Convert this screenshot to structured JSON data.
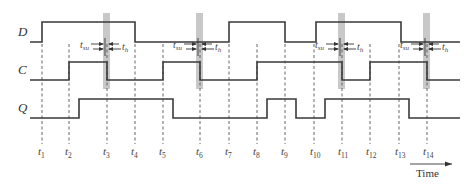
{
  "diagram": {
    "type": "timing-diagram",
    "signals": [
      {
        "name": "D",
        "y_high": 22,
        "y_low": 42,
        "transitions": [
          [
            30,
            "low"
          ],
          [
            42,
            "high"
          ],
          [
            135,
            "low"
          ],
          [
            229,
            "high"
          ],
          [
            285,
            "low"
          ],
          [
            316,
            "high"
          ],
          [
            401,
            "low"
          ],
          [
            460,
            "end"
          ]
        ]
      },
      {
        "name": "C",
        "y_high": 62,
        "y_low": 80,
        "transitions": [
          [
            30,
            "low"
          ],
          [
            69,
            "high"
          ],
          [
            107,
            "low"
          ],
          [
            163,
            "high"
          ],
          [
            200,
            "low"
          ],
          [
            257,
            "high"
          ],
          [
            342,
            "low"
          ],
          [
            370,
            "high"
          ],
          [
            427,
            "low"
          ],
          [
            460,
            "end"
          ]
        ]
      },
      {
        "name": "Q",
        "y_high": 99,
        "y_low": 118,
        "transitions": [
          [
            30,
            "low"
          ],
          [
            79,
            "high"
          ],
          [
            173,
            "low"
          ],
          [
            267,
            "high"
          ],
          [
            296,
            "low"
          ],
          [
            325,
            "high"
          ],
          [
            409,
            "low"
          ],
          [
            460,
            "end"
          ]
        ]
      }
    ],
    "time_markers": [
      {
        "base": "t",
        "sub": "1",
        "x": 42
      },
      {
        "base": "t",
        "sub": "2",
        "x": 69
      },
      {
        "base": "t",
        "sub": "3",
        "x": 107
      },
      {
        "base": "t",
        "sub": "4",
        "x": 135
      },
      {
        "base": "t",
        "sub": "5",
        "x": 163
      },
      {
        "base": "t",
        "sub": "6",
        "x": 200
      },
      {
        "base": "t",
        "sub": "7",
        "x": 229
      },
      {
        "base": "t",
        "sub": "8",
        "x": 257
      },
      {
        "base": "t",
        "sub": "9",
        "x": 285
      },
      {
        "base": "t",
        "sub": "10",
        "x": 314
      },
      {
        "base": "t",
        "sub": "11",
        "x": 342
      },
      {
        "base": "t",
        "sub": "12",
        "x": 370
      },
      {
        "base": "t",
        "sub": "13",
        "x": 399
      },
      {
        "base": "t",
        "sub": "14",
        "x": 427
      }
    ],
    "setup_hold_windows": [
      {
        "x": 107,
        "tsu_label": "t",
        "tsu_sub": "su",
        "th_label": "t",
        "th_sub": "h"
      },
      {
        "x": 200,
        "tsu_label": "t",
        "tsu_sub": "su",
        "th_label": "t",
        "th_sub": "h"
      },
      {
        "x": 342,
        "tsu_label": "t",
        "tsu_sub": "su",
        "th_label": "t",
        "th_sub": "h"
      },
      {
        "x": 427,
        "tsu_label": "t",
        "tsu_sub": "su",
        "th_label": "t",
        "th_sub": "h"
      }
    ],
    "time_axis_label": "Time",
    "colors": {
      "signal": "#3a3a3a",
      "window": "#c8c8c8",
      "dash": "#555555"
    }
  }
}
